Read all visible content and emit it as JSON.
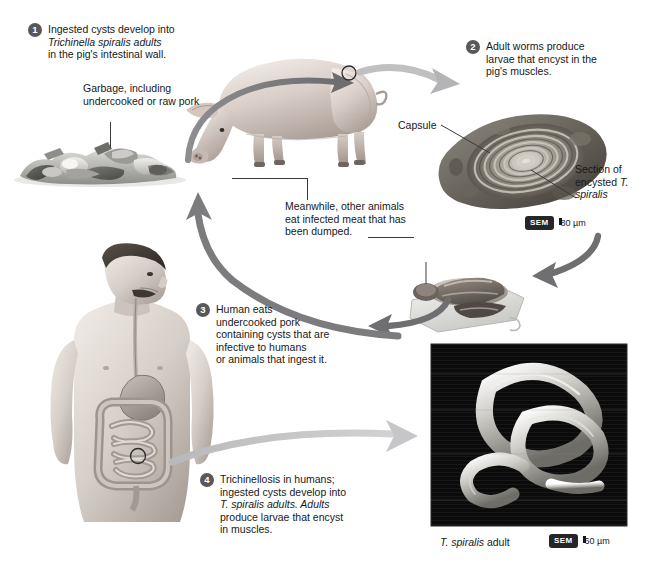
{
  "diagram": {
    "background": "#ffffff",
    "arrow_dark": "#7c7c7e",
    "arrow_light": "#c2c2c4",
    "badge_color": "#58585b"
  },
  "steps": [
    {
      "number": "1",
      "lines": [
        "Ingested cysts develop into",
        "Trichinella spiralis adults",
        "in the pig's intestinal wall."
      ],
      "italic_line_index": 1
    },
    {
      "number": "2",
      "lines": [
        "Adult worms produce",
        "larvae that encyst in the",
        "pig's muscles."
      ],
      "italic_line_index": -1
    },
    {
      "number": "3",
      "lines": [
        "Human eats",
        "undercooked pork",
        "containing cysts that are",
        "infective to humans",
        "or animals that ingest it."
      ],
      "italic_line_index": -1
    },
    {
      "number": "4",
      "lines": [
        "Trichinellosis in humans;",
        "ingested cysts develop into",
        "T. spiralis adults. Adults",
        "produce larvae that encyst",
        "in muscles."
      ],
      "italic_line_index": 2
    }
  ],
  "labels": {
    "garbage": [
      "Garbage, including",
      "undercooked or",
      "raw pork"
    ],
    "capsule": "Capsule",
    "section": [
      "Section of",
      "encysted",
      "T. spiralis"
    ],
    "meanwhile": [
      "Meanwhile, other",
      "animals eat infected",
      "meat that has",
      "been dumped."
    ],
    "adult_caption_italic": "T. spiralis",
    "adult_caption_rest": " adult"
  },
  "micrographs": [
    {
      "name": "encysted-larva-sem",
      "sem_label": "SEM",
      "scale_value": "80 µm"
    },
    {
      "name": "adult-worm-sem",
      "sem_label": "SEM",
      "scale_value": "60 µm"
    }
  ]
}
